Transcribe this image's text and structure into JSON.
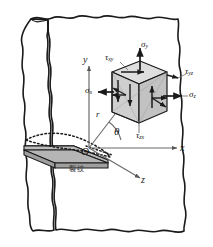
{
  "figure": {
    "background_color": "#ffffff",
    "ink_color": "#1a1a1a",
    "cube_face_color": "#c9c9c9",
    "cube_top_color": "#dedede",
    "crack_face_color": "#b5b5b5"
  },
  "axes": {
    "y_label": "y",
    "x_label": "x",
    "z_label": "z",
    "origin_label": "O"
  },
  "polar": {
    "radius_label": "r",
    "angle_label": "θ"
  },
  "stress_labels": {
    "sigma_x": "σ",
    "sigma_x_sub": "x",
    "sigma_y": "σ",
    "sigma_y_sub": "y",
    "sigma_z": "σ",
    "sigma_z_sub": "z",
    "tau_xy": "τ",
    "tau_xy_sub": "xy",
    "tau_yz": "τ",
    "tau_yz_sub": "yz",
    "tau_zx": "τ",
    "tau_zx_sub": "zx"
  },
  "annotations": {
    "crack_text": "裂纹"
  }
}
